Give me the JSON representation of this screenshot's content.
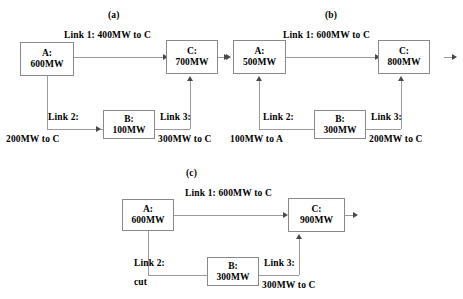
{
  "panels": [
    {
      "caption": "(a)",
      "nodes": [
        {
          "name": "A",
          "label_line1": "A:",
          "label_line2": "600MW"
        },
        {
          "name": "B",
          "label_line1": "B:",
          "label_line2": "100MW"
        },
        {
          "name": "C",
          "label_line1": "C:",
          "label_line2": "700MW"
        }
      ],
      "links": [
        {
          "id": "link1",
          "title": "Link 1: 400MW to C",
          "name": "Link 1:",
          "flow": "400MW to C"
        },
        {
          "id": "link2",
          "title": "Link 2:",
          "name": "Link 2:",
          "flow": "200MW to C"
        },
        {
          "id": "link3",
          "title": "Link 3:",
          "name": "Link 3:",
          "flow": "300MW to C"
        }
      ]
    },
    {
      "caption": "(b)",
      "nodes": [
        {
          "name": "A",
          "label_line1": "A:",
          "label_line2": "500MW"
        },
        {
          "name": "B",
          "label_line1": "B:",
          "label_line2": "300MW"
        },
        {
          "name": "C",
          "label_line1": "C:",
          "label_line2": "800MW"
        }
      ],
      "links": [
        {
          "id": "link1",
          "title": "Link 1:  600MW to C",
          "name": "Link 1:",
          "flow": "600MW to C"
        },
        {
          "id": "link2",
          "title": "Link 2:",
          "name": "Link 2:",
          "flow": "100MW to A"
        },
        {
          "id": "link3",
          "title": "Link 3:",
          "name": "Link 3:",
          "flow": "200MW to C"
        }
      ]
    },
    {
      "caption": "(c)",
      "nodes": [
        {
          "name": "A",
          "label_line1": "A:",
          "label_line2": "600MW"
        },
        {
          "name": "B",
          "label_line1": "B:",
          "label_line2": "300MW"
        },
        {
          "name": "C",
          "label_line1": "C:",
          "label_line2": "900MW"
        }
      ],
      "links": [
        {
          "id": "link1",
          "title": "Link 1:  600MW to C",
          "name": "Link 1:",
          "flow": "600MW to C"
        },
        {
          "id": "link2",
          "title": "Link 2:",
          "name": "Link 2:",
          "flow": "cut"
        },
        {
          "id": "link3",
          "title": "Link 3:",
          "name": "Link 3:",
          "flow": "300MW to C"
        }
      ]
    }
  ]
}
